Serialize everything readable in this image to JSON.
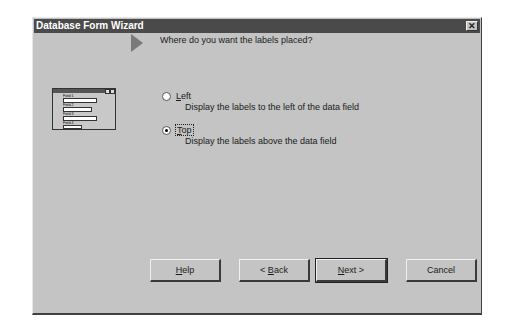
{
  "window": {
    "title": "Database Form Wizard",
    "close_icon": "close-icon"
  },
  "question": "Where do you want the labels placed?",
  "preview": {
    "fields": [
      "Field 1",
      "Field 2",
      "Field 3",
      "Field 4"
    ]
  },
  "options": [
    {
      "label": "Left",
      "mnemonic": "L",
      "description": "Display the labels to the left of the data field",
      "selected": false
    },
    {
      "label": "Top",
      "mnemonic": "T",
      "description": "Display the labels above the data field",
      "selected": true
    }
  ],
  "buttons": {
    "help": "Help",
    "back": "< Back",
    "next": "Next >",
    "cancel": "Cancel"
  },
  "colors": {
    "titlebar": "#4a4a4a",
    "face": "#c4c4c4"
  }
}
